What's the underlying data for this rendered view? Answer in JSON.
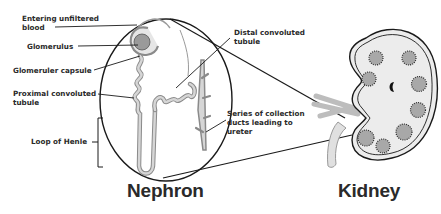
{
  "diagram": {
    "nephron": {
      "title": "Nephron",
      "labels": {
        "entering_blood": "Entering unfiltered\nblood",
        "glomerulus": "Glomerulus",
        "glomerular_capsule": "Glomeruler capsule",
        "proximal_tubule": "Proximal convoluted\ntubule",
        "loop_of_henle": "Loop of Henle",
        "distal_tubule": "Distal convoluted\ntubule",
        "collecting_ducts": "Series of collection\nducts leading to\nureter"
      }
    },
    "kidney": {
      "title": "Kidney"
    },
    "colors": {
      "line": "#1a1a1a",
      "text": "#2a2a2a",
      "tubule_fill": "#d0d0d0",
      "kidney_fill": "#ececec",
      "vessel_fill": "#c8c8c8"
    }
  }
}
